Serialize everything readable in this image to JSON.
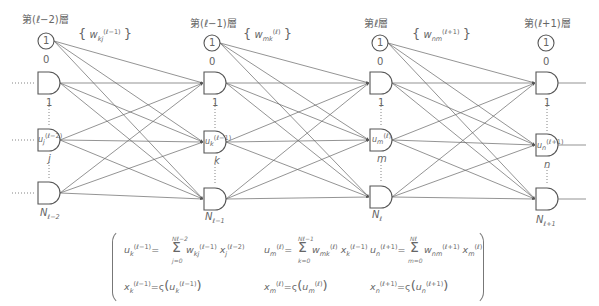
{
  "diagram": {
    "colors": {
      "stroke": "#555555",
      "text": "#666666",
      "background": "#ffffff"
    },
    "layers": [
      {
        "title": "第(ℓ−2)層",
        "bias_label": "1",
        "bias_index": "0",
        "node_labels": {
          "top": "1",
          "mid": "j",
          "bottom": "N",
          "bottom_sub": "ℓ−2"
        },
        "mid_node_var": "u",
        "mid_node_sub": "j",
        "mid_node_sup": "(ℓ−2)"
      },
      {
        "title": "第(ℓ−1)層",
        "bias_label": "1",
        "bias_index": "0",
        "node_labels": {
          "top": "1",
          "mid": "k",
          "bottom": "N",
          "bottom_sub": "ℓ−1"
        },
        "mid_node_var": "u",
        "mid_node_sub": "k",
        "mid_node_sup": "(ℓ−1)"
      },
      {
        "title": "第ℓ層",
        "bias_label": "1",
        "bias_index": "0",
        "node_labels": {
          "top": "1",
          "mid": "m",
          "bottom": "N",
          "bottom_sub": "ℓ"
        },
        "mid_node_var": "u",
        "mid_node_sub": "m",
        "mid_node_sup": "(ℓ)"
      },
      {
        "title": "第(ℓ+1)層",
        "bias_label": "1",
        "bias_index": "0",
        "node_labels": {
          "top": "1",
          "mid": "n",
          "bottom": "N",
          "bottom_sub": "ℓ+1"
        },
        "mid_node_var": "u",
        "mid_node_sub": "n",
        "mid_node_sup": "(ℓ+1)"
      }
    ],
    "weights": [
      {
        "var": "w",
        "sub": "kj",
        "sup": "(ℓ−1)"
      },
      {
        "var": "w",
        "sub": "mk",
        "sup": "(ℓ)"
      },
      {
        "var": "w",
        "sub": "nm",
        "sup": "(ℓ+1)"
      }
    ],
    "input_dots": "……",
    "formulas": {
      "col1": {
        "u_lhs": "u",
        "u_sub": "k",
        "u_sup": "(ℓ−1)",
        "sum_upper": "Nℓ−2",
        "sum_lower": "j=0",
        "w": "w",
        "w_sub": "kj",
        "w_sup": "(ℓ−1)",
        "x": "x",
        "x_sub": "j",
        "x_sup": "(ℓ−2)",
        "x_lhs": "x",
        "x_lhs_sub": "k",
        "x_lhs_sup": "(ℓ−1)",
        "act": "ς",
        "act_arg": "u",
        "act_arg_sub": "k",
        "act_arg_sup": "(ℓ−1)"
      },
      "col2": {
        "u_lhs": "u",
        "u_sub": "m",
        "u_sup": "(ℓ)",
        "sum_upper": "Nℓ−1",
        "sum_lower": "k=0",
        "w": "w",
        "w_sub": "mk",
        "w_sup": "(ℓ)",
        "x": "x",
        "x_sub": "k",
        "x_sup": "(ℓ−1)",
        "x_lhs": "x",
        "x_lhs_sub": "m",
        "x_lhs_sup": "(ℓ)",
        "act": "ς",
        "act_arg": "u",
        "act_arg_sub": "m",
        "act_arg_sup": "(ℓ)"
      },
      "col3": {
        "u_lhs": "u",
        "u_sub": "n",
        "u_sup": "(ℓ+1)",
        "sum_upper": "Nℓ",
        "sum_lower": "m=0",
        "w": "w",
        "w_sub": "nm",
        "w_sup": "(ℓ+1)",
        "x": "x",
        "x_sub": "m",
        "x_sup": "(ℓ)",
        "x_lhs": "x",
        "x_lhs_sub": "n",
        "x_lhs_sup": "(ℓ+1)",
        "act": "ς",
        "act_arg": "u",
        "act_arg_sub": "n",
        "act_arg_sup": "(ℓ+1)"
      },
      "equals": "=",
      "sigma": "Σ"
    }
  }
}
